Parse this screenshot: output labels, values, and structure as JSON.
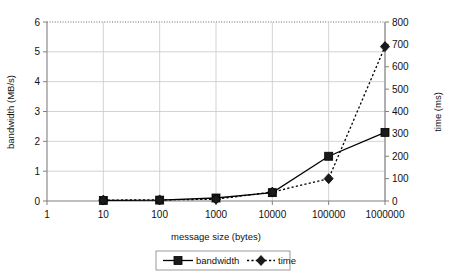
{
  "chart_data": {
    "type": "line",
    "title": "",
    "xlabel": "message size (bytes)",
    "ylabel": "bandwidth (MB/s)",
    "y2label": "time (ms)",
    "xscale": "log",
    "xlim": [
      1,
      1000000
    ],
    "ylim": [
      0,
      6
    ],
    "y2lim": [
      0,
      800
    ],
    "grid": true,
    "legend_position": "bottom",
    "x": [
      10,
      100,
      1000,
      10000,
      100000,
      1000000
    ],
    "xtick_labels": [
      "1",
      "10",
      "100",
      "1000",
      "10000",
      "100000",
      "1000000"
    ],
    "xtick_values": [
      1,
      10,
      100,
      1000,
      10000,
      100000,
      1000000
    ],
    "ytick_labels": [
      "0",
      "1",
      "2",
      "3",
      "4",
      "5",
      "6"
    ],
    "ytick_values": [
      0,
      1,
      2,
      3,
      4,
      5,
      6
    ],
    "y2tick_labels": [
      "0",
      "100",
      "200",
      "300",
      "400",
      "500",
      "600",
      "700",
      "800"
    ],
    "y2tick_values": [
      0,
      100,
      200,
      300,
      400,
      500,
      600,
      700,
      800
    ],
    "series": [
      {
        "name": "bandwidth",
        "axis": "left",
        "marker": "square",
        "linestyle": "solid",
        "color": "#000000",
        "values": [
          0.02,
          0.03,
          0.1,
          0.28,
          1.5,
          2.3
        ]
      },
      {
        "name": "time",
        "axis": "right",
        "marker": "diamond",
        "linestyle": "dotted",
        "color": "#000000",
        "values": [
          4,
          5,
          8,
          40,
          100,
          690
        ]
      }
    ]
  },
  "legend": {
    "items": [
      {
        "label": "bandwidth"
      },
      {
        "label": "time"
      }
    ]
  },
  "colors": {
    "line": "#000000",
    "grid": "#c8c8c8",
    "axis": "#808080",
    "background": "#ffffff"
  }
}
